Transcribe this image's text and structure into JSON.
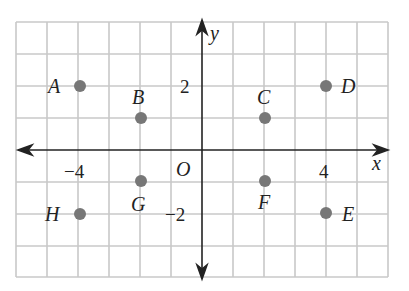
{
  "diagram": {
    "type": "coordinate-plane",
    "axes": {
      "x_label": "x",
      "y_label": "y",
      "origin_label": "O"
    },
    "grid": {
      "x_range": [
        -6,
        6
      ],
      "y_range": [
        -4,
        4
      ]
    },
    "tick_labels": {
      "x_neg": "−4",
      "x_pos": "4",
      "y_pos": "2",
      "y_neg": "−2"
    },
    "point_color": "#777777",
    "grid_color": "#c8c8c8",
    "points": [
      {
        "name": "A",
        "x": -4,
        "y": 2
      },
      {
        "name": "B",
        "x": -2,
        "y": 1
      },
      {
        "name": "C",
        "x": 2,
        "y": 1
      },
      {
        "name": "D",
        "x": 4,
        "y": 2
      },
      {
        "name": "E",
        "x": 4,
        "y": -2
      },
      {
        "name": "F",
        "x": 2,
        "y": -1
      },
      {
        "name": "G",
        "x": -2,
        "y": -1
      },
      {
        "name": "H",
        "x": -4,
        "y": -2
      }
    ]
  }
}
